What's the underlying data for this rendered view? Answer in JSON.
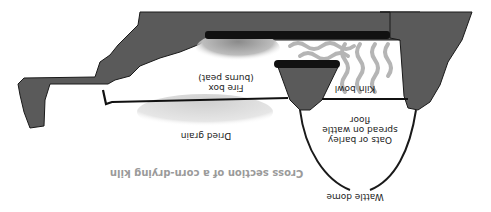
{
  "figure": {
    "title": "Cross section of a corn-drying kiln",
    "orientation": "rotated 180 degrees",
    "labels": {
      "fire_box": "Fire box",
      "fire_box_note": "(burns peat)",
      "kiln_bowl": "Kiln bowl",
      "grain_line1": "Oats or barley",
      "grain_line2": "spread on wattle",
      "grain_line3": "floor",
      "dried_grain": "Dried grain",
      "wattle_dome": "Wattle dome"
    },
    "colors": {
      "rock": "#5a5a5a",
      "outline": "#1a1a1a",
      "char": "#111111",
      "fire_glow": "#9a9a9a",
      "smoke": "#b5b5b5",
      "grain": "#d8d8d8",
      "title": "#9a9a9a"
    }
  }
}
